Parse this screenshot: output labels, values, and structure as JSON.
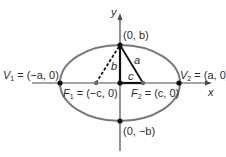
{
  "diagram": {
    "colors": {
      "ellipse": "#7a7a7a",
      "axes": "#4a4a4a",
      "segments": "#111111",
      "points": "#111111",
      "focus_points": "#6b6b6b",
      "text": "#2b2b2b"
    },
    "axes": {
      "x_label": "x",
      "y_label": "y"
    },
    "points": {
      "top": {
        "label": "(0, b)"
      },
      "bottom": {
        "label": "(0, −b)"
      },
      "v1": {
        "name": "V",
        "sub": "1",
        "eq": " = (−a, 0)"
      },
      "v2": {
        "name": "V",
        "sub": "2",
        "eq": " = (a, 0)"
      },
      "f1": {
        "name": "F",
        "sub": "1",
        "eq": " = (−c, 0)"
      },
      "f2": {
        "name": "F",
        "sub": "2",
        "eq": " = (c, 0)"
      }
    },
    "segments": {
      "b_label": "b",
      "a_label": "a",
      "c_label": "c"
    }
  }
}
